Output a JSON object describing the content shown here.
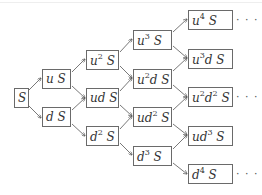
{
  "diagram": {
    "type": "binomial-tree",
    "root": "S",
    "columns": [
      [
        {
          "id": "S",
          "base": "",
          "html": "S"
        }
      ],
      [
        {
          "id": "uS",
          "html": "u S"
        },
        {
          "id": "dS",
          "html": "d S"
        }
      ],
      [
        {
          "id": "u2S",
          "html": "u<sup>2</sup> S"
        },
        {
          "id": "udS",
          "html": "ud S"
        },
        {
          "id": "d2S",
          "html": "d<sup>2</sup> S"
        }
      ],
      [
        {
          "id": "u3S",
          "html": "u<sup>3</sup> S"
        },
        {
          "id": "u2dS",
          "html": "u<sup>2</sup>d S"
        },
        {
          "id": "ud2S",
          "html": "ud<sup>2</sup> S"
        },
        {
          "id": "d3S",
          "html": "d<sup>3</sup> S"
        }
      ],
      [
        {
          "id": "u4S",
          "html": "u<sup>4</sup> S"
        },
        {
          "id": "u3dS",
          "html": "u<sup>3</sup>d S"
        },
        {
          "id": "u2d2S",
          "html": "u<sup>2</sup>d<sup>2</sup> S"
        },
        {
          "id": "ud3S",
          "html": "ud<sup>3</sup> S"
        },
        {
          "id": "d4S",
          "html": "d<sup>4</sup> S"
        }
      ]
    ],
    "labels": {
      "S": "S",
      "uS": "u S",
      "dS": "d S",
      "u2S": "u^2 S",
      "udS": "ud S",
      "d2S": "d^2 S",
      "u3S": "u^3 S",
      "u2dS": "u^2d S",
      "ud2S": "ud^2 S",
      "d3S": "d^3 S",
      "u4S": "u^4 S",
      "u3dS": "u^3d S",
      "u2d2S": "u^2d^2 S",
      "ud3S": "ud^3 S",
      "d4S": "d^4 S"
    },
    "continuation": "· · ·",
    "continued_nodes": [
      "u4S",
      "u2d2S",
      "d4S"
    ],
    "edge_color": "#555555",
    "border_color": "#6a6a6a"
  }
}
